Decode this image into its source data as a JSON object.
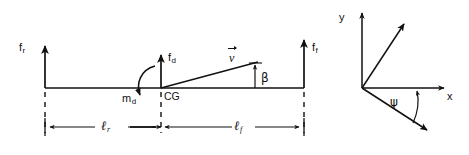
{
  "figure": {
    "line_color": "#111111",
    "background": "#ffffff"
  },
  "left_diagram": {
    "name": "free-body-beam-diagram",
    "labels": {
      "rear_force": {
        "base": "f",
        "sub": "r"
      },
      "front_force": {
        "base": "f",
        "sub": "f"
      },
      "disturbance_force": {
        "base": "f",
        "sub": "d"
      },
      "disturbance_moment": {
        "base": "m",
        "sub": "d"
      },
      "center_of_gravity": "CG",
      "velocity": "v",
      "sideslip_angle": "β",
      "rear_length": {
        "base": "ℓ",
        "sub": "r"
      },
      "front_length": {
        "base": "ℓ",
        "sub": "f"
      }
    }
  },
  "right_diagram": {
    "name": "coordinate-frame-diagram",
    "labels": {
      "body_y_axis": "y",
      "body_x_axis": "x",
      "inertial_y_axis": {
        "base": "y",
        "sub": "0"
      },
      "inertial_x_axis": {
        "base": "x",
        "sub": "0"
      },
      "yaw_angle": "ψ"
    }
  },
  "geometry": {
    "beam_y": 88,
    "rear_axle_x": 45,
    "cg_x": 161,
    "front_axle_x": 304,
    "dimension_line_y": 127,
    "frame_origin": {
      "x": 362,
      "y": 88
    }
  }
}
